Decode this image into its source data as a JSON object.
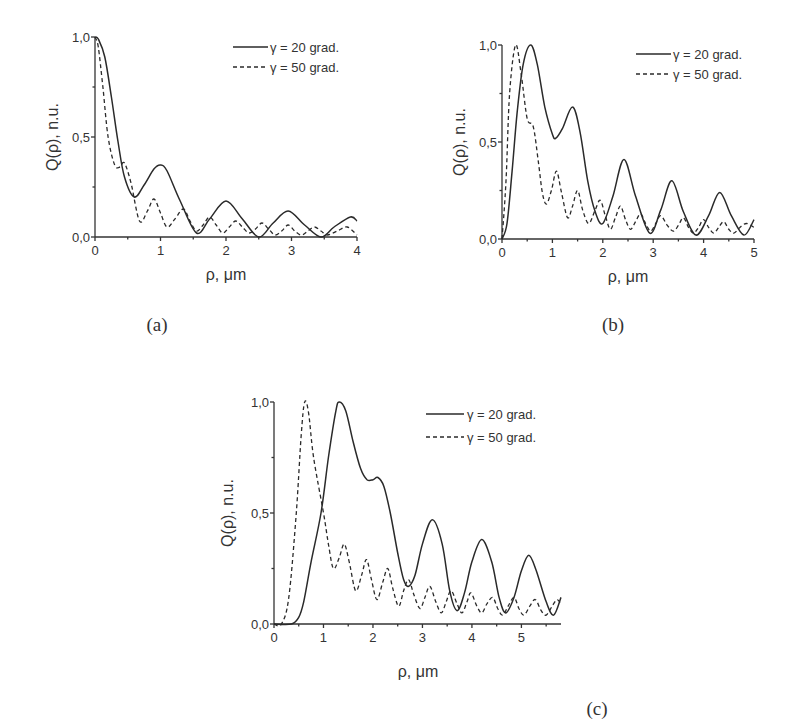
{
  "chart_data": [
    {
      "id": "a",
      "type": "line",
      "panel_label": "(a)",
      "xlabel": "ρ, μm",
      "ylabel": "Q(ρ), n.u.",
      "xlim": [
        0,
        4
      ],
      "ylim": [
        0,
        1
      ],
      "xticks": [
        "0",
        "1",
        "2",
        "3",
        "4"
      ],
      "yticks": [
        "0,0",
        "0,5",
        "1,0"
      ],
      "grid": false,
      "legend_position": "top-right",
      "series": [
        {
          "name": "γ = 20 grad.",
          "style": "solid",
          "x": [
            0,
            0.05,
            0.15,
            0.25,
            0.35,
            0.45,
            0.6,
            0.75,
            0.9,
            1.0,
            1.1,
            1.3,
            1.55,
            1.75,
            2.0,
            2.25,
            2.5,
            2.72,
            2.95,
            3.2,
            3.45,
            3.65,
            3.9,
            4.0
          ],
          "y": [
            1.0,
            0.99,
            0.9,
            0.7,
            0.48,
            0.3,
            0.2,
            0.26,
            0.34,
            0.36,
            0.33,
            0.18,
            0.02,
            0.09,
            0.18,
            0.09,
            0.0,
            0.07,
            0.13,
            0.06,
            0.0,
            0.05,
            0.1,
            0.08
          ]
        },
        {
          "name": "γ = 50 grad.",
          "style": "dashed",
          "x": [
            0,
            0.05,
            0.12,
            0.2,
            0.3,
            0.38,
            0.45,
            0.55,
            0.68,
            0.8,
            0.9,
            1.0,
            1.1,
            1.22,
            1.35,
            1.45,
            1.55,
            1.65,
            1.75,
            1.85,
            1.95,
            2.05,
            2.15,
            2.25,
            2.35,
            2.45,
            2.55,
            2.65,
            2.75,
            2.85,
            2.95,
            3.05,
            3.15,
            3.25,
            3.35,
            3.45,
            3.55,
            3.7,
            3.85,
            4.0
          ],
          "y": [
            1.0,
            0.95,
            0.75,
            0.5,
            0.36,
            0.35,
            0.37,
            0.27,
            0.08,
            0.13,
            0.19,
            0.12,
            0.05,
            0.09,
            0.14,
            0.08,
            0.03,
            0.06,
            0.1,
            0.06,
            0.02,
            0.05,
            0.08,
            0.05,
            0.02,
            0.04,
            0.07,
            0.04,
            0.01,
            0.03,
            0.06,
            0.03,
            0.01,
            0.03,
            0.05,
            0.03,
            0.01,
            0.03,
            0.05,
            0.01
          ]
        }
      ]
    },
    {
      "id": "b",
      "type": "line",
      "panel_label": "(b)",
      "xlabel": "ρ, μm",
      "ylabel": "Q(ρ), n.u.",
      "xlim": [
        0,
        5
      ],
      "ylim": [
        0,
        1
      ],
      "xticks": [
        "0",
        "1",
        "2",
        "3",
        "4",
        "5"
      ],
      "yticks": [
        "0,0",
        "0,5",
        "1,0"
      ],
      "grid": false,
      "legend_position": "top-right",
      "series": [
        {
          "name": "γ = 20 grad.",
          "style": "solid",
          "x": [
            0,
            0.1,
            0.2,
            0.3,
            0.42,
            0.57,
            0.7,
            0.85,
            1.0,
            1.07,
            1.2,
            1.4,
            1.55,
            1.7,
            1.85,
            2.0,
            2.2,
            2.42,
            2.65,
            2.93,
            3.15,
            3.37,
            3.6,
            3.85,
            4.1,
            4.32,
            4.55,
            4.8,
            5.0
          ],
          "y": [
            0.0,
            0.08,
            0.35,
            0.65,
            0.9,
            1.0,
            0.9,
            0.68,
            0.54,
            0.52,
            0.57,
            0.68,
            0.55,
            0.3,
            0.14,
            0.08,
            0.22,
            0.41,
            0.22,
            0.03,
            0.15,
            0.3,
            0.14,
            0.02,
            0.12,
            0.24,
            0.12,
            0.02,
            0.1
          ]
        },
        {
          "name": "γ = 50 grad.",
          "style": "dashed",
          "x": [
            0,
            0.08,
            0.15,
            0.27,
            0.38,
            0.5,
            0.62,
            0.72,
            0.8,
            0.88,
            0.98,
            1.08,
            1.18,
            1.3,
            1.4,
            1.5,
            1.6,
            1.72,
            1.85,
            1.95,
            2.05,
            2.15,
            2.25,
            2.35,
            2.45,
            2.55,
            2.65,
            2.75,
            2.85,
            2.95,
            3.05,
            3.15,
            3.28,
            3.4,
            3.5,
            3.6,
            3.7,
            3.8,
            3.9,
            4.0,
            4.1,
            4.2,
            4.3,
            4.4,
            4.5,
            4.6,
            4.72,
            4.85,
            5.0
          ],
          "y": [
            0.0,
            0.3,
            0.75,
            1.0,
            0.85,
            0.62,
            0.58,
            0.4,
            0.24,
            0.18,
            0.25,
            0.35,
            0.24,
            0.11,
            0.17,
            0.25,
            0.15,
            0.08,
            0.15,
            0.2,
            0.12,
            0.05,
            0.11,
            0.17,
            0.1,
            0.05,
            0.09,
            0.13,
            0.08,
            0.04,
            0.08,
            0.12,
            0.07,
            0.04,
            0.07,
            0.11,
            0.06,
            0.03,
            0.06,
            0.1,
            0.06,
            0.03,
            0.06,
            0.09,
            0.05,
            0.03,
            0.06,
            0.08,
            0.06
          ]
        }
      ]
    },
    {
      "id": "c",
      "type": "line",
      "panel_label": "(c)",
      "xlabel": "ρ, μm",
      "ylabel": "Q(ρ), n.u.",
      "xlim": [
        0,
        5.8
      ],
      "ylim": [
        0,
        1
      ],
      "xticks": [
        "0",
        "1",
        "2",
        "3",
        "4",
        "5"
      ],
      "yticks": [
        "0,0",
        "0,5",
        "1,0"
      ],
      "grid": false,
      "legend_position": "top-right",
      "series": [
        {
          "name": "γ = 20 grad.",
          "style": "solid",
          "x": [
            0,
            0.35,
            0.5,
            0.6,
            0.75,
            0.95,
            1.1,
            1.25,
            1.32,
            1.45,
            1.6,
            1.75,
            1.88,
            2.0,
            2.1,
            2.22,
            2.35,
            2.5,
            2.62,
            2.72,
            2.85,
            3.0,
            3.2,
            3.4,
            3.55,
            3.7,
            3.85,
            4.0,
            4.2,
            4.4,
            4.55,
            4.68,
            4.85,
            5.0,
            5.15,
            5.3,
            5.5,
            5.65,
            5.8
          ],
          "y": [
            0.0,
            0.0,
            0.03,
            0.1,
            0.28,
            0.5,
            0.75,
            0.96,
            1.0,
            0.96,
            0.82,
            0.7,
            0.65,
            0.65,
            0.66,
            0.62,
            0.5,
            0.32,
            0.2,
            0.17,
            0.22,
            0.36,
            0.47,
            0.36,
            0.15,
            0.06,
            0.14,
            0.28,
            0.38,
            0.28,
            0.12,
            0.05,
            0.12,
            0.24,
            0.31,
            0.24,
            0.1,
            0.04,
            0.12
          ]
        },
        {
          "name": "γ = 50 grad.",
          "style": "dashed",
          "x": [
            0,
            0.15,
            0.3,
            0.45,
            0.55,
            0.62,
            0.7,
            0.8,
            1.0,
            1.1,
            1.2,
            1.32,
            1.42,
            1.52,
            1.65,
            1.77,
            1.87,
            1.97,
            2.08,
            2.2,
            2.3,
            2.4,
            2.52,
            2.62,
            2.72,
            2.83,
            2.95,
            3.05,
            3.15,
            3.27,
            3.38,
            3.48,
            3.58,
            3.7,
            3.8,
            3.9,
            3.98,
            4.1,
            4.2,
            4.3,
            4.42,
            4.52,
            4.62,
            4.73,
            4.85,
            4.95,
            5.05,
            5.17,
            5.28,
            5.4,
            5.5,
            5.62,
            5.72,
            5.8
          ],
          "y": [
            0.0,
            0.0,
            0.12,
            0.5,
            0.85,
            1.0,
            0.95,
            0.75,
            0.5,
            0.36,
            0.25,
            0.3,
            0.36,
            0.28,
            0.15,
            0.22,
            0.29,
            0.2,
            0.11,
            0.19,
            0.25,
            0.16,
            0.08,
            0.15,
            0.2,
            0.13,
            0.07,
            0.12,
            0.17,
            0.1,
            0.05,
            0.1,
            0.15,
            0.09,
            0.05,
            0.1,
            0.14,
            0.08,
            0.05,
            0.09,
            0.12,
            0.07,
            0.04,
            0.08,
            0.12,
            0.07,
            0.04,
            0.08,
            0.11,
            0.06,
            0.04,
            0.08,
            0.11,
            0.09
          ]
        }
      ]
    }
  ],
  "panels": {
    "a": {
      "label": "(a)",
      "xlabel": "ρ, μm",
      "ylabel": "Q(ρ), n.u.",
      "legend": [
        "γ = 20 grad.",
        "γ = 50 grad."
      ]
    },
    "b": {
      "label": "(b)",
      "xlabel": "ρ, μm",
      "ylabel": "Q(ρ), n.u.",
      "legend": [
        "γ = 20 grad.",
        "γ = 50 grad."
      ]
    },
    "c": {
      "label": "(c)",
      "xlabel": "ρ, μm",
      "ylabel": "Q(ρ), n.u.",
      "legend": [
        "γ = 20 grad.",
        "γ = 50 grad."
      ]
    }
  }
}
